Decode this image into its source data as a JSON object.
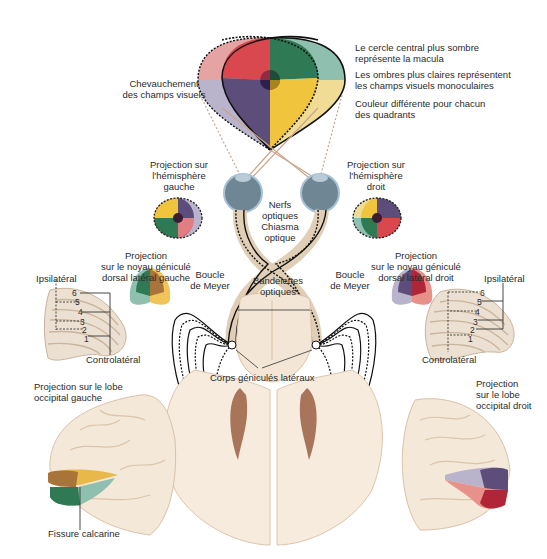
{
  "colors": {
    "red": "#d9474f",
    "red_light": "#e8a3a3",
    "green": "#2f7a55",
    "green_light": "#8fbfae",
    "purple": "#5c4d7a",
    "purple_light": "#b9b4cc",
    "yellow": "#f0c43c",
    "yellow_light": "#f1dc95",
    "brain": "#f3e6d6",
    "brain_edge": "#d9c2a8",
    "eye": "#6f8794",
    "ventricle": "#a8745a"
  },
  "legend": {
    "macula": [
      "Le cercle central plus sombre",
      "représente la macula"
    ],
    "monocular": [
      "Les ombres plus claires représentent",
      "les champs visuels monoculaires"
    ],
    "quadrants": [
      "Couleur différente pour chacun",
      "des quadrants"
    ]
  },
  "labels": {
    "overlap": [
      "Chevauchement",
      "des champs visuels"
    ],
    "proj_left_hemi": [
      "Projection sur",
      "l'hémisphère",
      "gauche"
    ],
    "proj_right_hemi": [
      "Projection sur",
      "l'hémisphère",
      "droit"
    ],
    "optic_nerves": [
      "Nerfs",
      "optiques"
    ],
    "chiasm": [
      "Chiasma",
      "optique"
    ],
    "optic_tracts": [
      "Bandelettes",
      "optiques"
    ],
    "meyer_left": [
      "Boucle",
      "de Meyer"
    ],
    "meyer_right": [
      "Boucle",
      "de Meyer"
    ],
    "lgn_left": [
      "Projection",
      "sur le noyau géniculé",
      "dorsal latéral gauche"
    ],
    "lgn_right": [
      "Projection",
      "sur le noyau géniculé",
      "dorsal latéral droit"
    ],
    "ipsi_left": "Ipsilatéral",
    "contra_left": "Controlatéral",
    "ipsi_right": "Ipsilatéral",
    "contra_right": "Controlatéral",
    "lgb": "Corps géniculés latéraux",
    "occ_left": [
      "Projection sur le lobe",
      "occipital gauche"
    ],
    "occ_right": [
      "Projection",
      "sur le lobe",
      "occipital droit"
    ],
    "calcarine": "Fissure calcarine"
  },
  "lgn_layers": [
    "6",
    "5",
    "4",
    "3",
    "2",
    "1"
  ]
}
